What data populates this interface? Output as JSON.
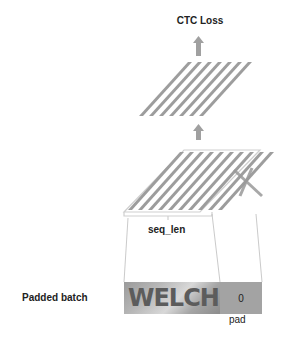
{
  "diagram": {
    "output_label": "CTC Loss",
    "sequence_label": "seq_len",
    "batch_label": "Padded batch",
    "batch_image_text": "WELCH",
    "pad_value": "0",
    "pad_label": "pad"
  },
  "colors": {
    "bar_fill": "#8f8f8f",
    "bar_highlight": "#b5b5b5",
    "arrow": "#a0a0a0",
    "outline": "#c8c8c8",
    "pad_cell": "#a3a3a3",
    "text": "#222222"
  },
  "layers": [
    {
      "name": "top-layer",
      "bar_count": 7
    },
    {
      "name": "bottom-layer",
      "bar_count": 10,
      "masked_bars": 3
    }
  ]
}
